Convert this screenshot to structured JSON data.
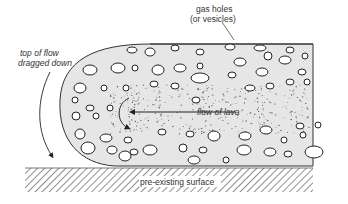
{
  "diagram": {
    "labels": {
      "gas_holes_line1": "gas holes",
      "gas_holes_line2": "(or vesicles)",
      "top_of_flow_line1": "top of flow",
      "top_of_flow_line2": "dragged down",
      "flow_of_lava": "flow of lava",
      "pre_existing_surface": "pre-existing surface"
    },
    "colors": {
      "lava_fill": "#e6e6e6",
      "outline": "#333333",
      "vesicle_fill": "#ffffff",
      "hatch": "#444444",
      "background": "#ffffff"
    }
  }
}
